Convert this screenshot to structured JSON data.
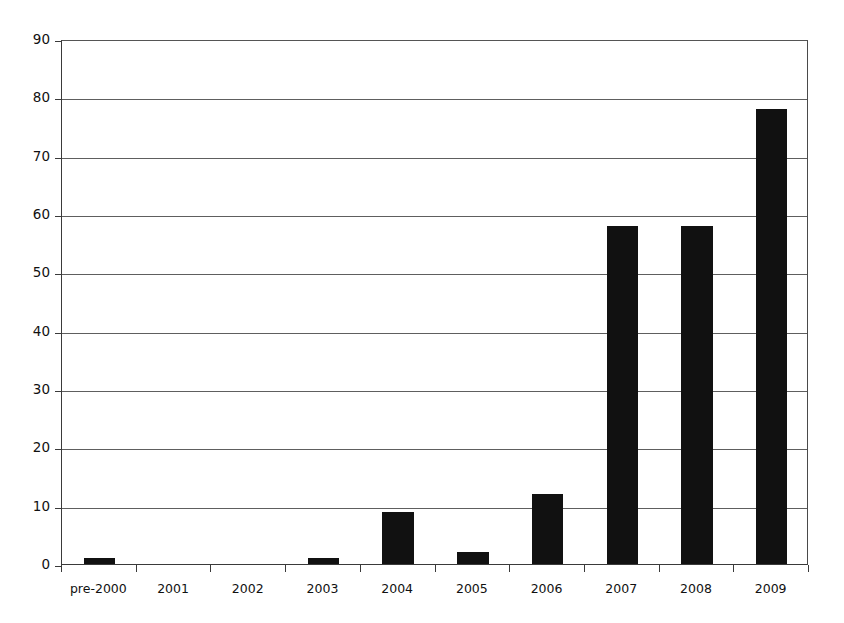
{
  "chart_data": {
    "type": "bar",
    "title": "",
    "subtitle": "",
    "xlabel": "",
    "ylabel": "",
    "categories": [
      "pre-2000",
      "2001",
      "2002",
      "2003",
      "2004",
      "2005",
      "2006",
      "2007",
      "2008",
      "2009"
    ],
    "values": [
      1,
      0,
      0,
      1,
      9,
      2,
      12,
      58,
      58,
      78
    ],
    "series": [
      {
        "name": "count",
        "values": [
          1,
          0,
          0,
          1,
          9,
          2,
          12,
          58,
          58,
          78
        ]
      }
    ],
    "ylim": [
      0,
      90
    ],
    "ytick_step": 10,
    "ytick_labels": [
      "0",
      "10",
      "20",
      "30",
      "40",
      "50",
      "60",
      "70",
      "80",
      "90"
    ],
    "ytick_values": [
      0,
      10,
      20,
      30,
      40,
      50,
      60,
      70,
      80,
      90
    ],
    "grid": "horizontal",
    "legend": "none",
    "bar_color": "#111111",
    "gridline_color": "#5e5e5e",
    "axis_color": "#3a3a3a",
    "background_color": "#ffffff",
    "annotations": []
  }
}
